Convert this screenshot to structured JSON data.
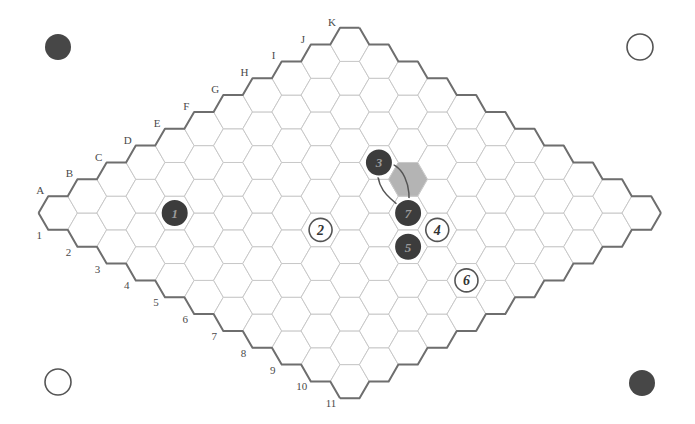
{
  "diagram": {
    "title": "",
    "type": "hex-board",
    "board_size": 11,
    "column_labels": [
      "A",
      "B",
      "C",
      "D",
      "E",
      "F",
      "G",
      "H",
      "I",
      "J",
      "K"
    ],
    "row_labels": [
      "1",
      "2",
      "3",
      "4",
      "5",
      "6",
      "7",
      "8",
      "9",
      "10",
      "11"
    ],
    "geometry": {
      "origin_x": 58,
      "origin_y": 213,
      "side": 19.45
    },
    "colors": {
      "black_stone": "#3c3c3c",
      "white_stone": "#ffffff",
      "grid": "#c8c8c8",
      "edge": "#6e6e6e",
      "shaded_cell": "#b4b4b4"
    },
    "stones": [
      {
        "move": "1",
        "color": "black",
        "cell": "C3"
      },
      {
        "move": "2",
        "color": "white",
        "cell": "E6"
      },
      {
        "move": "3",
        "color": "black",
        "cell": "H5"
      },
      {
        "move": "4",
        "color": "white",
        "cell": "G8"
      },
      {
        "move": "5",
        "color": "black",
        "cell": "F8"
      },
      {
        "move": "6",
        "color": "white",
        "cell": "F10"
      },
      {
        "move": "7",
        "color": "black",
        "cell": "G7"
      }
    ],
    "shaded_cells": [
      "H6"
    ],
    "bridges": [
      {
        "from": "H5",
        "to": "G7"
      }
    ],
    "corner_markers": [
      {
        "position": "top-left",
        "color": "black",
        "x": 58,
        "y": 47
      },
      {
        "position": "top-right",
        "color": "white",
        "x": 640,
        "y": 47
      },
      {
        "position": "bottom-left",
        "color": "white",
        "x": 58,
        "y": 382
      },
      {
        "position": "bottom-right",
        "color": "black",
        "x": 642,
        "y": 383
      }
    ]
  }
}
